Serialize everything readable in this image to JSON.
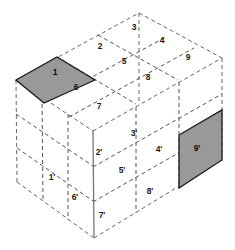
{
  "diagram": {
    "colors": {
      "background": "#ffffff",
      "shaded_fill": "#999999",
      "shaded_stroke": "#1a1a1a",
      "grid_line": "#555555",
      "edge_line": "#666666",
      "solid_edge": "#777777",
      "label_text": "#1a1a1a"
    },
    "geometry": {
      "top_apex": [
        139,
        13
      ],
      "left_top": [
        16,
        80
      ],
      "right_top": [
        222,
        58
      ],
      "center": [
        93,
        131
      ],
      "left_bottom": [
        17,
        182
      ],
      "right_bottom": [
        222,
        160
      ],
      "bottom_apex": [
        94,
        238
      ]
    },
    "faces": {
      "top": {
        "name": "top-face",
        "labels": [
          "1",
          "2",
          "3",
          "4",
          "5",
          "6",
          "7",
          "8",
          "9"
        ]
      },
      "left": {
        "name": "left-face",
        "labels": [
          "1'",
          "2'",
          "6'",
          "7'"
        ]
      },
      "right": {
        "name": "right-face",
        "labels": [
          "3'",
          "4'",
          "5'",
          "8'",
          "9'"
        ]
      }
    },
    "cells": [
      {
        "id": "cell-1",
        "label": "1",
        "face": "top",
        "shaded": true,
        "cx": 55,
        "cy": 73
      },
      {
        "id": "cell-2",
        "label": "2",
        "face": "top",
        "shaded": false,
        "cx": 100,
        "cy": 47
      },
      {
        "id": "cell-3",
        "label": "3",
        "face": "top",
        "shaded": false,
        "cx": 137,
        "cy": 27
      },
      {
        "id": "cell-4",
        "label": "4",
        "face": "top",
        "shaded": false,
        "cx": 162,
        "cy": 41
      },
      {
        "id": "cell-5",
        "label": "5",
        "face": "top",
        "shaded": false,
        "cx": 124,
        "cy": 62
      },
      {
        "id": "cell-6",
        "label": "6",
        "face": "top",
        "shaded": false,
        "cx": 76,
        "cy": 88
      },
      {
        "id": "cell-7",
        "label": "7",
        "face": "top",
        "shaded": false,
        "cx": 99,
        "cy": 107
      },
      {
        "id": "cell-8",
        "label": "8",
        "face": "top",
        "shaded": false,
        "cx": 148,
        "cy": 78
      },
      {
        "id": "cell-9",
        "label": "9",
        "face": "top",
        "shaded": false,
        "cx": 188,
        "cy": 58
      },
      {
        "id": "cell-1p",
        "label": "1'",
        "face": "left",
        "shaded": false,
        "cx": 52,
        "cy": 178
      },
      {
        "id": "cell-2p",
        "label": "2'",
        "face": "left",
        "shaded": false,
        "cx": 99,
        "cy": 153
      },
      {
        "id": "cell-6p",
        "label": "6'",
        "face": "left",
        "shaded": false,
        "cx": 75,
        "cy": 198
      },
      {
        "id": "cell-7p",
        "label": "7'",
        "face": "left",
        "shaded": false,
        "cx": 102,
        "cy": 216
      },
      {
        "id": "cell-3p",
        "label": "3'",
        "face": "right",
        "shaded": false,
        "cx": 134,
        "cy": 134
      },
      {
        "id": "cell-4p",
        "label": "4'",
        "face": "right",
        "shaded": false,
        "cx": 159,
        "cy": 150
      },
      {
        "id": "cell-5p",
        "label": "5'",
        "face": "right",
        "shaded": false,
        "cx": 122,
        "cy": 171
      },
      {
        "id": "cell-8p",
        "label": "8'",
        "face": "right",
        "shaded": false,
        "cx": 150,
        "cy": 192
      },
      {
        "id": "cell-9p",
        "label": "9'",
        "face": "right",
        "shaded": true,
        "cx": 189,
        "cy": 164
      }
    ]
  }
}
